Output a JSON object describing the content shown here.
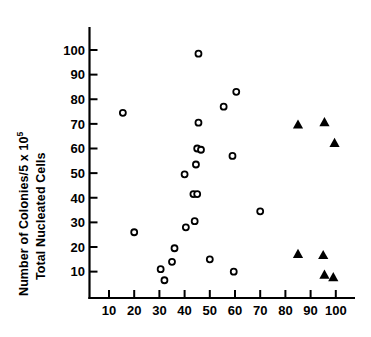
{
  "chart_data": {
    "type": "scatter",
    "title": "",
    "xlabel": "",
    "ylabel": "Number of Colonies/5 x 10⁵ Total Nucleated Cells",
    "ylabel_line1": "Number of Colonies/5 x 10",
    "ylabel_line1_sup": "5",
    "ylabel_line2": "Total Nucleated Cells",
    "xlim": [
      5,
      107
    ],
    "ylim": [
      2,
      105
    ],
    "grid": false,
    "legend": "none",
    "xticks": [
      10,
      20,
      30,
      40,
      50,
      60,
      70,
      80,
      90,
      100
    ],
    "xtick_labels": [
      "10",
      "20",
      "30",
      "40",
      "50",
      "60",
      "70",
      "80",
      "90",
      "100"
    ],
    "yticks": [
      10,
      20,
      30,
      40,
      50,
      60,
      70,
      80,
      90,
      100
    ],
    "ytick_labels": [
      "10",
      "20",
      "30",
      "40",
      "50",
      "60",
      "70",
      "80",
      "90",
      "100"
    ],
    "series": [
      {
        "name": "open-circles",
        "marker": "open-circle",
        "color": "#000000",
        "points": [
          [
            15.5,
            74.5
          ],
          [
            20.0,
            26.0
          ],
          [
            30.5,
            11.0
          ],
          [
            32.0,
            6.5
          ],
          [
            35.0,
            14.0
          ],
          [
            36.0,
            19.5
          ],
          [
            40.5,
            28.0
          ],
          [
            40.0,
            49.5
          ],
          [
            44.0,
            30.5
          ],
          [
            43.5,
            41.5
          ],
          [
            45.0,
            41.5
          ],
          [
            44.5,
            53.5
          ],
          [
            45.0,
            60.0
          ],
          [
            46.5,
            59.5
          ],
          [
            45.5,
            70.5
          ],
          [
            45.5,
            98.5
          ],
          [
            50.0,
            15.0
          ],
          [
            55.5,
            77.0
          ],
          [
            59.0,
            57.0
          ],
          [
            59.5,
            10.0
          ],
          [
            60.5,
            83.0
          ],
          [
            70.0,
            34.5
          ]
        ]
      },
      {
        "name": "filled-triangles",
        "marker": "filled-triangle",
        "color": "#000000",
        "points": [
          [
            85.0,
            69.5
          ],
          [
            95.5,
            70.5
          ],
          [
            99.5,
            62.0
          ],
          [
            85.0,
            17.0
          ],
          [
            95.0,
            16.5
          ],
          [
            95.5,
            8.5
          ],
          [
            99.0,
            7.5
          ]
        ]
      }
    ]
  },
  "axes": {
    "x_axis_name": "x-axis",
    "y_axis_name": "y-axis"
  }
}
